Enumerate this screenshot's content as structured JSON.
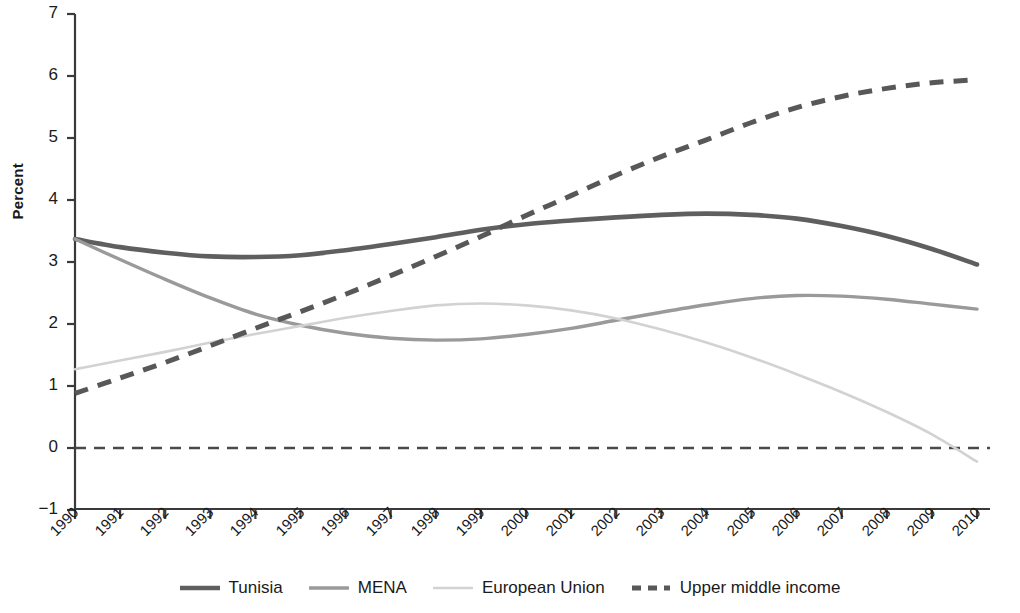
{
  "chart_data": {
    "type": "line",
    "title": "",
    "xlabel": "",
    "ylabel": "Percent",
    "xlim": [
      1990,
      2010
    ],
    "ylim": [
      -1,
      7
    ],
    "grid": false,
    "legend_position": "bottom",
    "x": [
      1990,
      1991,
      1992,
      1993,
      1994,
      1995,
      1996,
      1997,
      1998,
      1999,
      2000,
      2001,
      2002,
      2003,
      2004,
      2005,
      2006,
      2007,
      2008,
      2009,
      2010
    ],
    "xtick_labels": [
      "1990",
      "1991",
      "1992",
      "1993",
      "1994",
      "1995",
      "1996",
      "1997",
      "1998",
      "1999",
      "2000",
      "2001",
      "2002",
      "2003",
      "2004",
      "2005",
      "2006",
      "2007",
      "2008",
      "2009",
      "2010"
    ],
    "ytick_labels": [
      "7",
      "6",
      "5",
      "4",
      "3",
      "2",
      "1",
      "0",
      "−1"
    ],
    "ytick_values": [
      7,
      6,
      5,
      4,
      3,
      2,
      1,
      0,
      -1
    ],
    "zero_line": 0,
    "series": [
      {
        "name": "Tunisia",
        "color": "#5f5f5f",
        "style": "solid",
        "width": 4.6,
        "values": [
          3.37,
          3.24,
          3.15,
          3.09,
          3.08,
          3.11,
          3.19,
          3.29,
          3.4,
          3.52,
          3.61,
          3.67,
          3.72,
          3.76,
          3.78,
          3.76,
          3.7,
          3.58,
          3.42,
          3.21,
          2.96
        ]
      },
      {
        "name": "MENA",
        "color": "#9a9a9a",
        "style": "solid",
        "width": 3.4,
        "values": [
          3.37,
          3.04,
          2.72,
          2.42,
          2.16,
          1.98,
          1.85,
          1.77,
          1.74,
          1.76,
          1.83,
          1.93,
          2.06,
          2.19,
          2.31,
          2.41,
          2.46,
          2.45,
          2.4,
          2.32,
          2.24
        ]
      },
      {
        "name": "European Union",
        "color": "#d2d2d2",
        "style": "solid",
        "width": 2.6,
        "values": [
          1.27,
          1.41,
          1.55,
          1.7,
          1.84,
          1.97,
          2.1,
          2.21,
          2.3,
          2.33,
          2.3,
          2.22,
          2.09,
          1.91,
          1.7,
          1.46,
          1.19,
          0.9,
          0.58,
          0.22,
          -0.22
        ]
      },
      {
        "name": "Upper middle income",
        "color": "#585858",
        "style": "dashed",
        "width": 5.0,
        "values": [
          0.88,
          1.13,
          1.38,
          1.65,
          1.93,
          2.2,
          2.48,
          2.78,
          3.09,
          3.41,
          3.75,
          4.07,
          4.4,
          4.7,
          4.97,
          5.25,
          5.49,
          5.67,
          5.8,
          5.89,
          5.94
        ]
      }
    ]
  },
  "axes": {
    "y_label": "Percent"
  },
  "legend": {
    "items": [
      {
        "label": "Tunisia"
      },
      {
        "label": "MENA"
      },
      {
        "label": "European Union"
      },
      {
        "label": "Upper middle income"
      }
    ]
  }
}
